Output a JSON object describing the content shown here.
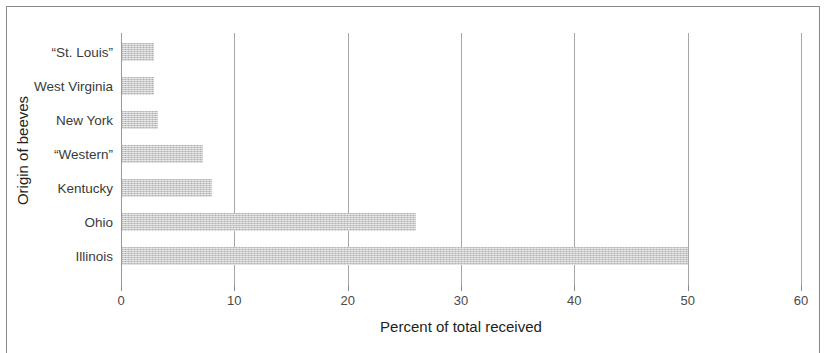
{
  "chart_data": {
    "type": "bar",
    "orientation": "horizontal",
    "title": "",
    "xlabel": "Percent of total received",
    "ylabel": "Origin of beeves",
    "categories": [
      "Illinois",
      "Ohio",
      "Kentucky",
      "“Western”",
      "New York",
      "West Virginia",
      "“St. Louis”"
    ],
    "values": [
      50.0,
      26.0,
      8.0,
      7.2,
      3.3,
      2.9,
      2.9
    ],
    "xlim": [
      0,
      60
    ],
    "xticks": [
      0,
      10,
      20,
      30,
      40,
      50,
      60
    ],
    "xticklabels": [
      "0",
      "10",
      "20",
      "30",
      "40",
      "50",
      "60"
    ],
    "grid": "vertical",
    "legend": "none",
    "bar_color": "#c9c9c9",
    "gridline_color": "#a6a6a6",
    "text_color": "#231f20",
    "display_order_top_to_bottom": [
      "“St. Louis”",
      "West Virginia",
      "New York",
      "“Western”",
      "Kentucky",
      "Ohio",
      "Illinois"
    ]
  }
}
